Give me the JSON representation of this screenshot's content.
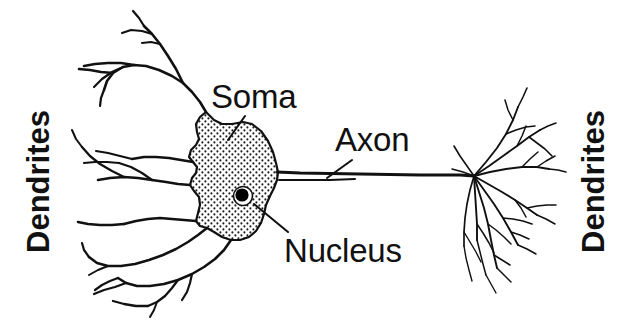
{
  "figure": {
    "background_color": "#ffffff",
    "ink_color": "#111111"
  },
  "labels": {
    "soma": "Soma",
    "axon": "Axon",
    "nucleus": "Nucleus",
    "dendrites_left": "Dendrites",
    "dendrites_right": "Dendrites"
  },
  "parts": {
    "soma_name": "soma",
    "axon_name": "axon",
    "nucleus_name": "nucleus",
    "dendrite_tree_left_name": "dendrite-tree-left",
    "dendrite_tree_right_name": "axon-terminal-dendrites"
  },
  "leader_lines": {
    "soma": "from Soma text down-left to soma membrane",
    "axon": "from Axon text down-left to axon shaft",
    "nucleus": "from Nucleus text up-left to nucleus dot"
  },
  "colors": {
    "outline": "#111111",
    "stipple": "#1a1a1a",
    "nucleus_fill": "#000000",
    "background": "#ffffff"
  }
}
